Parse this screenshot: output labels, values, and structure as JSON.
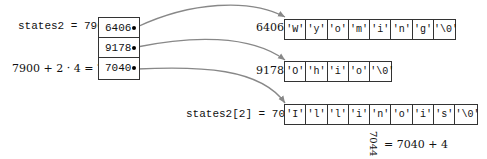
{
  "labels": {
    "base": "states2 = 7900",
    "offset_expr": "7900 + 2 · 4 = 7908",
    "elem2": "states2[2] = 7040",
    "rotated_addr": "7044",
    "rotated_expr": "= 7040 + 4"
  },
  "pointer_array": [
    {
      "value": "6406"
    },
    {
      "value": "9178"
    },
    {
      "value": "7040"
    }
  ],
  "strings": [
    {
      "address": "6406",
      "chars": [
        "'W'",
        "'y'",
        "'o'",
        "'m'",
        "'i'",
        "'n'",
        "'g'",
        "'\\0'"
      ]
    },
    {
      "address": "9178",
      "chars": [
        "'O'",
        "'h'",
        "'i'",
        "'o'",
        "'\\0'"
      ]
    },
    {
      "address": "7040",
      "chars": [
        "'I'",
        "'l'",
        "'l'",
        "'i'",
        "'n'",
        "'o'",
        "'i'",
        "'s'",
        "'\\0'"
      ]
    }
  ],
  "colors": {
    "arrow": "#888888",
    "border": "#333333"
  }
}
